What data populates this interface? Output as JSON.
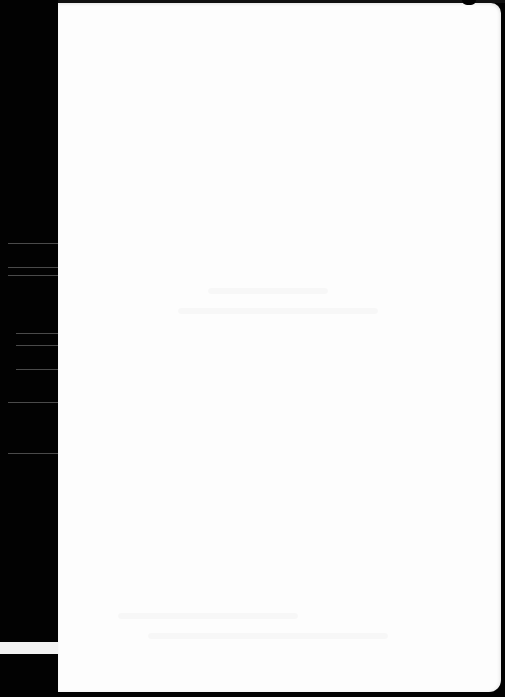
{
  "document": {
    "type": "scanned-blank-page",
    "visible_text": "",
    "colors": {
      "background": "#020202",
      "page": "#fdfdfd",
      "streaks": "#4a4a4a"
    }
  }
}
